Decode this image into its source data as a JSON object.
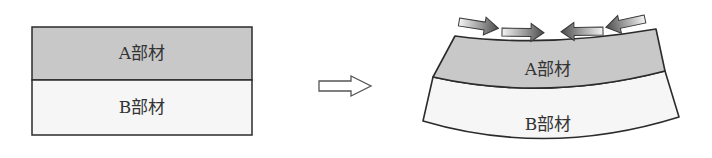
{
  "diagram": {
    "before": {
      "layers": [
        {
          "label": "A部材",
          "fill": "#c8c8c8"
        },
        {
          "label": "B部材",
          "fill": "#f6f6f6"
        }
      ]
    },
    "transition_arrow": {
      "direction": "right",
      "icon": "hollow-right-arrow-icon"
    },
    "after": {
      "layers": [
        {
          "label": "A部材",
          "fill": "#c8c8c8"
        },
        {
          "label": "B部材",
          "fill": "#f6f6f6"
        }
      ],
      "force_arrows": [
        {
          "direction": "right",
          "icon": "compression-arrow-icon"
        },
        {
          "direction": "right",
          "icon": "compression-arrow-icon"
        },
        {
          "direction": "left",
          "icon": "compression-arrow-icon"
        },
        {
          "direction": "left",
          "icon": "compression-arrow-icon"
        }
      ]
    },
    "colors": {
      "outline": "#2b2b2b",
      "layer_a": "#c8c8c8",
      "layer_b": "#f6f6f6"
    }
  }
}
